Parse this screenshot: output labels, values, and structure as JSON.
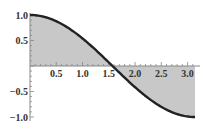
{
  "chart_data": {
    "type": "area",
    "title": "",
    "xlabel": "",
    "ylabel": "",
    "function": "cos(x)",
    "xlim": [
      0,
      3.14159
    ],
    "ylim": [
      -1.0,
      1.0
    ],
    "grid": false,
    "legend": null,
    "fill": "to x-axis",
    "x_ticks": [
      0.5,
      1.0,
      1.5,
      2.0,
      2.5,
      3.0
    ],
    "x_tick_labels": [
      "0.5",
      "1.0",
      "1.5",
      "2.0",
      "2.5",
      "3.0"
    ],
    "y_ticks": [
      1.0,
      0.5,
      -0.5,
      -1.0
    ],
    "y_tick_labels": [
      "1.0",
      "0.5",
      "−0.5",
      "−1.0"
    ],
    "series": [
      {
        "name": "cos(x)",
        "x": [
          0,
          0.25,
          0.5,
          0.75,
          1.0,
          1.25,
          1.5,
          1.5708,
          1.75,
          2.0,
          2.25,
          2.5,
          2.75,
          3.0,
          3.1416
        ],
        "y": [
          1.0,
          0.969,
          0.878,
          0.732,
          0.54,
          0.315,
          0.071,
          0.0,
          -0.178,
          -0.416,
          -0.628,
          -0.801,
          -0.924,
          -0.99,
          -1.0
        ]
      }
    ],
    "colors": {
      "curve": "#222222",
      "fill": "#c8c8c8",
      "axis": "#888888"
    }
  }
}
